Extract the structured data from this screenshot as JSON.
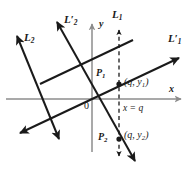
{
  "figure": {
    "background_color": "#ffffff",
    "ink_color": "#1a1a1a",
    "axis_color": "#8c8c8c",
    "width": 193,
    "height": 170
  },
  "axes": {
    "x_label": "x",
    "y_label": "y",
    "origin_label": "0",
    "origin_px": {
      "x": 92,
      "y": 99
    },
    "x_axis": {
      "x1": 6,
      "y1": 99,
      "x2": 181,
      "y2": 99
    },
    "y_axis": {
      "x1": 92,
      "y1": 152,
      "x2": 92,
      "y2": 24
    }
  },
  "lines": [
    {
      "id": "L1",
      "label": "L",
      "sub": "1",
      "prime": "",
      "label_px": {
        "x": 113,
        "y": 12
      },
      "description": "steep negative-slope line through origin, labelled at top",
      "x1": 55,
      "y1": 19,
      "x2": 137,
      "y2": 164
    },
    {
      "id": "L2prime",
      "label": "L",
      "sub": "2",
      "prime": "′",
      "label_px": {
        "x": 65,
        "y": 17
      },
      "description": "same steep negative-slope line, labelled near upper-left arrow"
    },
    {
      "id": "L1prime",
      "label": "L",
      "sub": "1",
      "prime": "′",
      "label_px": {
        "x": 170,
        "y": 36
      },
      "description": "shallow positive-slope line through origin toward upper right",
      "x1": 18,
      "y1": 134,
      "x2": 180,
      "y2": 57
    },
    {
      "id": "L2",
      "label": "L",
      "sub": "2",
      "prime": "",
      "label_px": {
        "x": 25,
        "y": 34
      },
      "description": "shallow positive-slope line parallel to L1-prime, upper-left",
      "x1": 16,
      "y1": 34,
      "x2": 63,
      "y2": 141
    }
  ],
  "points": [
    {
      "id": "P1",
      "label": "P",
      "sub": "1",
      "label_px": {
        "x": 97,
        "y": 72
      },
      "coord_text": "(q, y",
      "coord_sub": "1",
      "coord_close": ")",
      "coord_px": {
        "x": 124,
        "y": 82
      },
      "dot_px": {
        "x": 119,
        "y": 84
      }
    },
    {
      "id": "P2",
      "label": "P",
      "sub": "2",
      "label_px": {
        "x": 99,
        "y": 135
      },
      "coord_text": "(q, y",
      "coord_sub": "2",
      "coord_close": ")",
      "coord_px": {
        "x": 124,
        "y": 133
      },
      "dot_px": {
        "x": 119,
        "y": 139
      }
    }
  ],
  "vertical_line": {
    "equation_prefix": "x = ",
    "equation_value": "q",
    "equation_text": "x = q",
    "label_px": {
      "x": 123,
      "y": 107
    },
    "style": "dashed",
    "x": 119,
    "y_top": 28,
    "y_bottom": 158
  }
}
